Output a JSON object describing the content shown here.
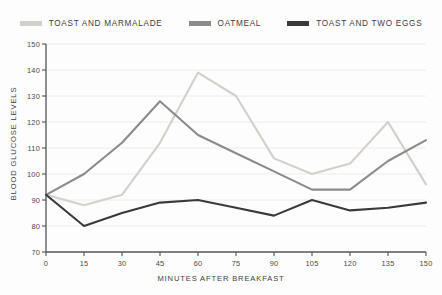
{
  "chart_data": {
    "type": "line",
    "title": "",
    "xlabel": "MINUTES AFTER BREAKFAST",
    "ylabel": "BLOOD GLUCOSE LEVELS",
    "xlim": [
      0,
      150
    ],
    "ylim": [
      70,
      150
    ],
    "xticks": [
      0,
      15,
      30,
      45,
      60,
      75,
      90,
      105,
      120,
      135,
      150
    ],
    "yticks": [
      70,
      80,
      90,
      100,
      110,
      120,
      130,
      140,
      150
    ],
    "xtick_labels": [
      "0",
      "15",
      "30",
      "45",
      "60",
      "75",
      "90",
      "105",
      "120",
      "135",
      "150"
    ],
    "ytick_labels": [
      "70",
      "80",
      "90",
      "100",
      "110",
      "120",
      "130",
      "140",
      "150"
    ],
    "grid": true,
    "grid_axis": "y",
    "legend_position": "top-center",
    "x": [
      0,
      15,
      30,
      45,
      60,
      75,
      90,
      105,
      120,
      135,
      150
    ],
    "series": [
      {
        "name": "TOAST AND MARMALADE",
        "color": "#d3d0cb",
        "values": [
          92,
          88,
          92,
          112,
          139,
          130,
          106,
          100,
          104,
          120,
          96
        ]
      },
      {
        "name": "OATMEAL",
        "color": "#8b8b8b",
        "values": [
          92,
          100,
          112,
          128,
          115,
          108,
          101,
          94,
          94,
          105,
          113
        ]
      },
      {
        "name": "TOAST AND TWO EGGS",
        "color": "#3a3a3a",
        "values": [
          92,
          80,
          85,
          89,
          90,
          87,
          84,
          90,
          86,
          87,
          89
        ]
      }
    ]
  },
  "colors": {
    "background": "#fdfdfd",
    "axis": "#555555",
    "grid": "#ececec",
    "text": "#4a4a4a"
  }
}
